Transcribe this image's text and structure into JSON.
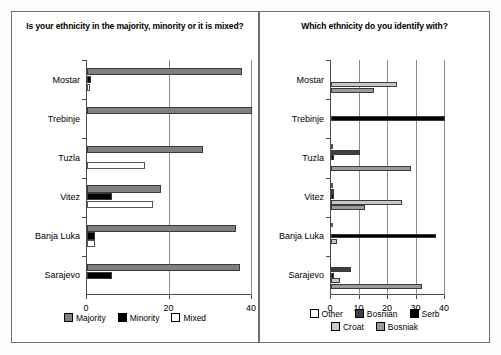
{
  "figure": {
    "width": 501,
    "height": 355,
    "background": "#ffffff"
  },
  "panels": [
    {
      "id": "left",
      "title": "Is your ethnicity in the majority, minority or it is mixed?"
    },
    {
      "id": "right",
      "title": "Which ethnicity do you identify with?"
    }
  ],
  "colors": {
    "majority": "#808080",
    "minority": "#000000",
    "mixed": "#ffffff",
    "other": "#ffffff",
    "bosnian": "#3f3f3f",
    "serb": "#000000",
    "croat": "#c8c8c8",
    "bosniak": "#9a9a9a",
    "axis": "#4a4a4a",
    "grid": "#8c8c8c",
    "panel_border": "#6f6f6f"
  },
  "chart_data": [
    {
      "type": "bar",
      "orientation": "horizontal",
      "title": "Is your ethnicity in the majority, minority or it is mixed?",
      "xlabel": "",
      "ylabel": "",
      "xlim": [
        0,
        40
      ],
      "xticks": [
        0,
        20,
        40
      ],
      "xticklabels": [
        "0",
        "20",
        "40"
      ],
      "grid": true,
      "legend_position": "bottom",
      "categories": [
        "Mostar",
        "Trebinje",
        "Tuzla",
        "Vitez",
        "Banja Luka",
        "Sarajevo"
      ],
      "series": [
        {
          "name": "Majority",
          "color": "#808080",
          "values": [
            37.5,
            40.0,
            28.0,
            18.0,
            36.0,
            37.0
          ]
        },
        {
          "name": "Minority",
          "color": "#000000",
          "values": [
            1.0,
            0.0,
            0.0,
            6.0,
            2.0,
            6.0
          ]
        },
        {
          "name": "Mixed",
          "color": "#ffffff",
          "values": [
            0.8,
            0.0,
            14.0,
            16.0,
            2.0,
            0.0
          ]
        }
      ]
    },
    {
      "type": "bar",
      "orientation": "horizontal",
      "title": "Which ethnicity do you identify with?",
      "xlabel": "",
      "ylabel": "",
      "xlim": [
        0,
        40
      ],
      "xticks": [
        0,
        10,
        20,
        30,
        40
      ],
      "xticklabels": [
        "0",
        "10",
        "20",
        "30",
        "40"
      ],
      "grid": true,
      "legend_position": "bottom",
      "categories": [
        "Mostar",
        "Trebinje",
        "Tuzla",
        "Vitez",
        "Banja Luka",
        "Sarajevo"
      ],
      "series": [
        {
          "name": "Other",
          "color": "#ffffff",
          "values": [
            0.0,
            0.0,
            0.6,
            0.6,
            0.6,
            0.0
          ]
        },
        {
          "name": "Bosnian",
          "color": "#3f3f3f",
          "values": [
            0.0,
            0.0,
            10.0,
            1.0,
            0.0,
            7.0
          ]
        },
        {
          "name": "Serb",
          "color": "#000000",
          "values": [
            0.0,
            40.0,
            1.0,
            1.0,
            37.0,
            1.0
          ]
        },
        {
          "name": "Croat",
          "color": "#c8c8c8",
          "values": [
            23.0,
            0.0,
            0.0,
            25.0,
            2.0,
            3.0
          ]
        },
        {
          "name": "Bosniak",
          "color": "#9a9a9a",
          "values": [
            15.0,
            0.0,
            28.0,
            12.0,
            0.0,
            32.0
          ]
        }
      ]
    }
  ]
}
